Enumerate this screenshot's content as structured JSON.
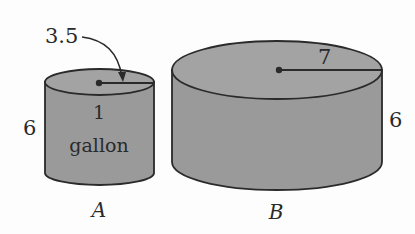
{
  "figure": {
    "fill_color": "#9a9a9a",
    "stroke_color": "#2a2a2a",
    "cylinders": [
      {
        "id": "A",
        "label": "A",
        "radius_label": "3.5",
        "height_label": "6",
        "content_line1": "1",
        "content_line2": "gallon"
      },
      {
        "id": "B",
        "label": "B",
        "radius_label": "7",
        "height_label": "6"
      }
    ]
  }
}
